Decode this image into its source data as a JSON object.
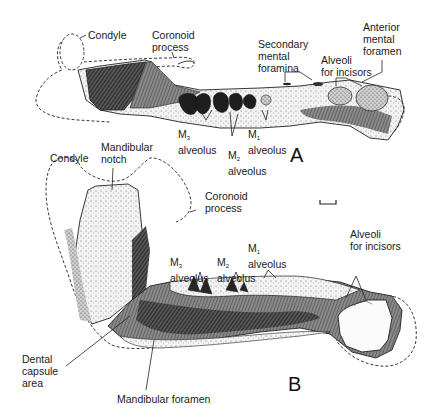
{
  "figure": {
    "panels": [
      {
        "id": "A",
        "letter": "A",
        "labels": {
          "condyle": "Condyle",
          "coronoid_process": [
            "Coronoid",
            "process"
          ],
          "secondary_mental_foramina": [
            "Secondary",
            "mental",
            "foramina"
          ],
          "anterior_mental_foramen": [
            "Anterior",
            "mental",
            "foramen"
          ],
          "alveoli_for_incisors": [
            "Alveoli",
            "for incisors"
          ],
          "m3_alveolus": {
            "tooth": "M",
            "sub": "3",
            "word": "alveolus"
          },
          "m2_alveolus": {
            "tooth": "M",
            "sub": "2",
            "word": "alveolus"
          },
          "m1_alveolus": {
            "tooth": "M",
            "sub": "1",
            "word": "alveolus"
          }
        }
      },
      {
        "id": "B",
        "letter": "B",
        "labels": {
          "condyle": "Condyle",
          "mandibular_notch": [
            "Mandibular",
            "notch"
          ],
          "coronoid_process": [
            "Coronoid",
            "process"
          ],
          "alveoli_for_incisors": [
            "Alveoli",
            "for incisors"
          ],
          "m3_alveolus": {
            "tooth": "M",
            "sub": "3",
            "word": "alveolus"
          },
          "m2_alveolus": {
            "tooth": "M",
            "sub": "2",
            "word": "alveolus"
          },
          "m1_alveolus": {
            "tooth": "M",
            "sub": "1",
            "word": "alveolus"
          },
          "dental_capsule_area": [
            "Dental",
            "capsule",
            "area"
          ],
          "mandibular_foramen": "Mandibular foramen"
        }
      }
    ],
    "scale_bar": "scale-bar",
    "colors": {
      "ink": "#111111",
      "bone": "#f4f4f4",
      "shade_dark": "#3a3a3a",
      "shade_mid": "#7a7a7a",
      "shade_light": "#b8b8b8"
    }
  }
}
